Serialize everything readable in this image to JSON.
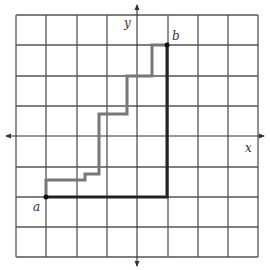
{
  "diagram": {
    "type": "lattice-path-grid",
    "grid": {
      "columns": 8,
      "rows": 8,
      "line_color": "#555555"
    },
    "axes": {
      "x_label": "x",
      "y_label": "y",
      "color": "#333333"
    },
    "points": [
      {
        "label": "a",
        "grid": [
          -3,
          -2
        ]
      },
      {
        "label": "b",
        "grid": [
          1,
          3
        ]
      }
    ],
    "paths": [
      {
        "name": "staircase-path",
        "color": "#777777",
        "description": "gray staircase path from a to b"
      },
      {
        "name": "corner-path",
        "color": "#222222",
        "description": "thick black path: right from a then up to b"
      }
    ]
  },
  "labels": {
    "a": "a",
    "b": "b",
    "x": "x",
    "y": "y"
  }
}
